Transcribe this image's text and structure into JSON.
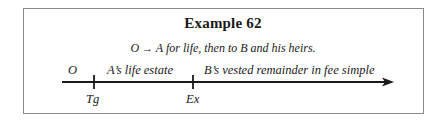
{
  "title": "Example 62",
  "conveyance": {
    "grantor": "O",
    "arrow": "→",
    "text": "A for life, then to B and his heirs."
  },
  "timeline": {
    "segments": [
      {
        "label": "O"
      },
      {
        "label": "A’s life estate"
      },
      {
        "label": "B’s vested remainder in fee simple"
      }
    ],
    "ticks": [
      {
        "label": "Tg"
      },
      {
        "label": "Ex"
      }
    ]
  }
}
